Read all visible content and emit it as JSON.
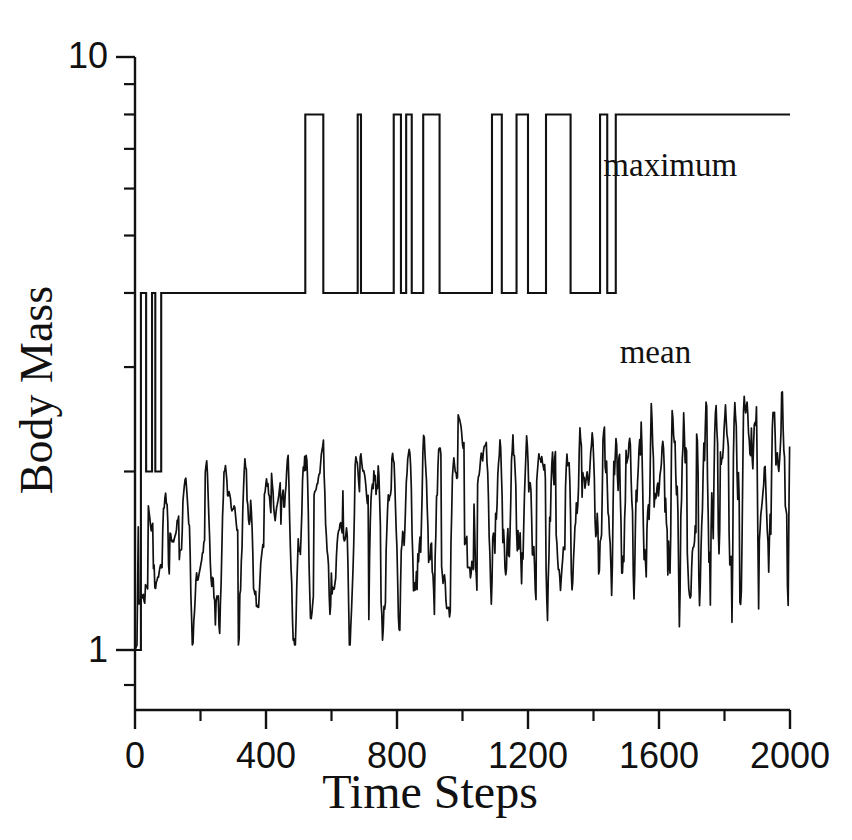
{
  "figure": {
    "background": "#ffffff",
    "ink_color": "#111111",
    "width": 852,
    "height": 840
  },
  "chart_data": {
    "type": "line",
    "title": "",
    "xlabel": "Time Steps",
    "ylabel": "Body Mass",
    "xlim": [
      0,
      2000
    ],
    "ylim": [
      1,
      10
    ],
    "yscale": "log",
    "xscale": "linear",
    "grid": false,
    "legend_position": "inline-annotations",
    "x_ticks_major": [
      0,
      400,
      800,
      1200,
      1600,
      2000
    ],
    "x_ticks_minor": [
      200,
      600,
      1000,
      1400,
      1800
    ],
    "x_tick_labels": [
      "0",
      "400",
      "800",
      "1200",
      "1600",
      "2000"
    ],
    "y_ticks_major": [
      1,
      10
    ],
    "y_tick_labels": [
      "1",
      "10"
    ],
    "y_ticks_minor": [
      2,
      3,
      4,
      5,
      6,
      7,
      8,
      9
    ],
    "series": [
      {
        "name": "maximum",
        "style": "step",
        "label": "maximum",
        "label_x": 1430,
        "label_y": 6.3,
        "low_level": 4.0,
        "high_level": 8.0,
        "start_level": 1.0,
        "dip_level": 2.0,
        "steps": [
          [
            0,
            1.0
          ],
          [
            18,
            1.0
          ],
          [
            18,
            4.0
          ],
          [
            34,
            4.0
          ],
          [
            34,
            2.0
          ],
          [
            52,
            2.0
          ],
          [
            52,
            4.0
          ],
          [
            62,
            4.0
          ],
          [
            62,
            2.0
          ],
          [
            80,
            2.0
          ],
          [
            80,
            4.0
          ],
          [
            520,
            4.0
          ],
          [
            520,
            8.0
          ],
          [
            575,
            8.0
          ],
          [
            575,
            4.0
          ],
          [
            680,
            4.0
          ],
          [
            680,
            8.0
          ],
          [
            690,
            8.0
          ],
          [
            690,
            4.0
          ],
          [
            790,
            4.0
          ],
          [
            790,
            8.0
          ],
          [
            812,
            8.0
          ],
          [
            812,
            4.0
          ],
          [
            828,
            4.0
          ],
          [
            828,
            8.0
          ],
          [
            845,
            8.0
          ],
          [
            845,
            4.0
          ],
          [
            880,
            4.0
          ],
          [
            880,
            8.0
          ],
          [
            930,
            8.0
          ],
          [
            930,
            4.0
          ],
          [
            1090,
            4.0
          ],
          [
            1090,
            8.0
          ],
          [
            1120,
            8.0
          ],
          [
            1120,
            4.0
          ],
          [
            1165,
            4.0
          ],
          [
            1165,
            8.0
          ],
          [
            1200,
            8.0
          ],
          [
            1200,
            4.0
          ],
          [
            1255,
            4.0
          ],
          [
            1255,
            8.0
          ],
          [
            1330,
            8.0
          ],
          [
            1330,
            4.0
          ],
          [
            1420,
            4.0
          ],
          [
            1420,
            8.0
          ],
          [
            1442,
            8.0
          ],
          [
            1442,
            4.0
          ],
          [
            1468,
            4.0
          ],
          [
            1468,
            8.0
          ],
          [
            2000,
            8.0
          ]
        ]
      },
      {
        "name": "mean",
        "style": "oscillating",
        "label": "mean",
        "label_x": 1480,
        "label_y": 3.05,
        "start_value": 1.0,
        "baseline_start": 1.42,
        "baseline_end": 1.95,
        "range_min": 1.02,
        "range_max": 2.85,
        "oscillation_period": 62,
        "key_peaks": [
          [
            45,
            1.95
          ],
          [
            120,
            1.78
          ],
          [
            300,
            1.92
          ],
          [
            430,
            2.1
          ],
          [
            560,
            2.18
          ],
          [
            700,
            2.25
          ],
          [
            1000,
            2.82
          ],
          [
            1060,
            2.3
          ],
          [
            1240,
            2.12
          ],
          [
            1380,
            2.18
          ],
          [
            1600,
            2.05
          ],
          [
            1800,
            2.45
          ],
          [
            1870,
            2.7
          ],
          [
            1960,
            2.4
          ]
        ],
        "key_troughs": [
          [
            25,
            1.0
          ],
          [
            70,
            1.22
          ],
          [
            200,
            1.38
          ],
          [
            380,
            1.3
          ],
          [
            620,
            1.35
          ],
          [
            950,
            1.12
          ],
          [
            1020,
            1.05
          ],
          [
            1300,
            1.3
          ],
          [
            1700,
            1.18
          ],
          [
            1920,
            1.68
          ]
        ]
      }
    ]
  },
  "axes": {
    "y_axis_label": "Body Mass",
    "x_axis_label": "Time Steps",
    "y_top_label": "10",
    "y_bottom_label": "1"
  }
}
